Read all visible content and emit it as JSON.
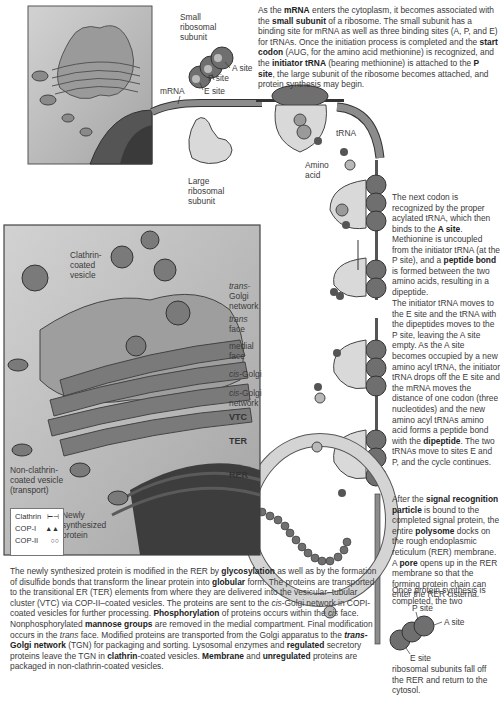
{
  "diagram": {
    "top_labels": {
      "small_subunit": "Small\nribosomal\nsubunit",
      "a_site": "A site",
      "p_site": "P site",
      "e_site": "E site",
      "mrna": "mRNA",
      "large_subunit": "Large\nribosomal\nsubunit",
      "trna": "tRNA",
      "amino_acid": "Amino\nacid"
    },
    "golgi_labels": {
      "clathrin_vesicle": "Clathrin-\ncoated\nvesicle",
      "trans_golgi_network_italic": "trans-",
      "trans_golgi_network_rest": "Golgi\nnetwork",
      "trans_face_italic": "trans",
      "trans_face_rest": "face",
      "medial_face": "medial\nface",
      "cis_golgi_italic": "cis",
      "cis_golgi_rest": "-Golgi",
      "cis_golgi_network_italic": "cis",
      "cis_golgi_network_rest": "-Golgi\nnetwork",
      "vtc": "VTC",
      "ter": "TER",
      "rer": "RER",
      "non_clathrin_vesicle": "Non-clathrin-\ncoated vesicle\n(transport)",
      "newly_synthesized": "Newly\nsynthesized\nprotein"
    },
    "legend": [
      {
        "label": "Clathrin",
        "symbol": "⊢⊣"
      },
      {
        "label": "COP-I",
        "symbol": "▲▲"
      },
      {
        "label": "COP-II",
        "symbol": "○○"
      }
    ],
    "bottom_labels": {
      "p_site": "P site",
      "a_site": "A site",
      "e_site": "E site"
    },
    "paragraphs": {
      "p1": [
        {
          "t": "As the "
        },
        {
          "b": "mRNA"
        },
        {
          "t": " enters the cytoplasm, it becomes associated with the "
        },
        {
          "b": "small subunit"
        },
        {
          "t": " of a ribosome. The small subunit has a binding site for mRNA as well as three binding sites (A, P, and E) for tRNAs. Once the initiation process is completed and the "
        },
        {
          "b": "start codon"
        },
        {
          "t": " (AUG, for the amino acid methionine) is recognized, and the "
        },
        {
          "b": "initiator tRNA"
        },
        {
          "t": " (bearing methionine) is attached to the "
        },
        {
          "b": "P site"
        },
        {
          "t": ", the large subunit of the ribosome becomes attached, and protein synthesis may begin."
        }
      ],
      "p2": [
        {
          "t": "The next codon is recognized by the proper acylated tRNA, which then binds to the "
        },
        {
          "b": "A site"
        },
        {
          "t": "."
        }
      ],
      "p3": [
        {
          "t": "Methionine is uncoupled from the initiator tRNA (at the P site), and a "
        },
        {
          "b": "peptide bond"
        },
        {
          "t": " is formed between the two amino acids, resulting in a dipeptide."
        }
      ],
      "p4": [
        {
          "t": "The initiator tRNA moves to the E site and the tRNA with the dipeptides moves to the P site, leaving the A site empty. As the A site becomes occupied by a new amino acyl tRNA, the initiator tRNA drops off the E site and the mRNA moves the distance of one codon (three nucleotides) and the new amino acyl tRNAs amino acid forms a peptide bond with the "
        },
        {
          "b": "dipeptide"
        },
        {
          "t": ". The two tRNAs move to sites E and P, and the cycle continues."
        }
      ],
      "p5": [
        {
          "t": "After the "
        },
        {
          "b": "signal recognition particle"
        },
        {
          "t": " is bound to the completed signal protein, the entire "
        },
        {
          "b": "polysome"
        },
        {
          "t": " docks on the rough endoplasmic reticulum (RER) membrane. A "
        },
        {
          "b": "pore"
        },
        {
          "t": " opens up in the RER membrane so that the forming protein chain can enter the RER cisterna."
        }
      ],
      "p6": [
        {
          "t": "Once protein synthesis is completed, the two"
        }
      ],
      "p7": [
        {
          "t": "ribosomal subunits fall off the RER and return to the cytosol."
        }
      ],
      "p8": [
        {
          "t": "The newly synthesized protein is modified in the RER by "
        },
        {
          "b": "glycosylation"
        },
        {
          "t": " as well as by the formation of disulfide bonds that transform the linear protein into "
        },
        {
          "b": "globular"
        },
        {
          "t": " form. The proteins are transported to the transitional ER (TER) elements from where they are delivered into the vesicular–tubular cluster (VTC) via COP-II–coated vesicles. The proteins are sent to the "
        },
        {
          "i": "cis"
        },
        {
          "t": "-Golgi network in COPI-coated vesicles for further processing. "
        },
        {
          "b": "Phosphorylation"
        },
        {
          "t": " of proteins occurs within the "
        },
        {
          "i": "cis"
        },
        {
          "t": " face. Nonphosphorylated "
        },
        {
          "b": "mannose groups"
        },
        {
          "t": " are removed in the medial compartment. Final modification occurs in the "
        },
        {
          "i": "trans"
        },
        {
          "t": " face. Modified proteins are transported from the Golgi apparatus to the "
        },
        {
          "bi": "trans"
        },
        {
          "b": "-Golgi network"
        },
        {
          "t": " (TGN) for packaging and sorting. Lysosomal enzymes and "
        },
        {
          "b": "regulated"
        },
        {
          "t": " secretory proteins leave the TGN in "
        },
        {
          "b": "clathrin"
        },
        {
          "t": "-coated vesicles. "
        },
        {
          "b": "Membrane"
        },
        {
          "t": " and "
        },
        {
          "b": "unregulated"
        },
        {
          "t": " proteins are packaged in non-clathrin-coated vesicles."
        }
      ]
    },
    "colors": {
      "ribosome_dark": "#6f6f6f",
      "ribosome_light": "#d9d9d9",
      "mrna_band": "#8c8c8c",
      "rer_membrane": "#d4d4d4",
      "panel_bg": "#b5b5b5",
      "nucleus": "#3d3d3d",
      "text": "#3a3a3a"
    }
  }
}
